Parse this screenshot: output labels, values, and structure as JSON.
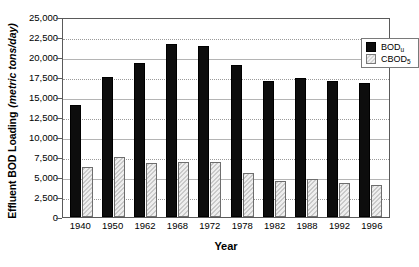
{
  "chart_data": {
    "type": "bar",
    "title": "",
    "xlabel": "Year",
    "ylabel": "Effluent BOD Loading",
    "ylabel_units": "(metric tons/day)",
    "categories": [
      "1940",
      "1950",
      "1962",
      "1968",
      "1972",
      "1978",
      "1982",
      "1988",
      "1992",
      "1996"
    ],
    "series": [
      {
        "name": "BOD_u",
        "label": "BOD",
        "label_sub": "u",
        "color": "#0d0d0d",
        "values": [
          14000,
          17500,
          19200,
          21600,
          21400,
          19000,
          17000,
          17400,
          17000,
          16800
        ]
      },
      {
        "name": "CBOD_5",
        "label": "CBOD",
        "label_sub": "5",
        "color": "#d6d6d6",
        "values": [
          6300,
          7500,
          6800,
          6900,
          6900,
          5500,
          4500,
          4700,
          4300,
          4000
        ]
      }
    ],
    "ylim": [
      0,
      25000
    ],
    "ytick_values": [
      0,
      2500,
      5000,
      7500,
      10000,
      12500,
      15000,
      17500,
      20000,
      22500,
      25000
    ],
    "ytick_labels": [
      "0",
      "2,500",
      "5,000",
      "7,500",
      "10,000",
      "12,500",
      "15,000",
      "17,500",
      "20,000",
      "22,500",
      "25,000"
    ],
    "grid": true,
    "legend_position": "top-right"
  }
}
